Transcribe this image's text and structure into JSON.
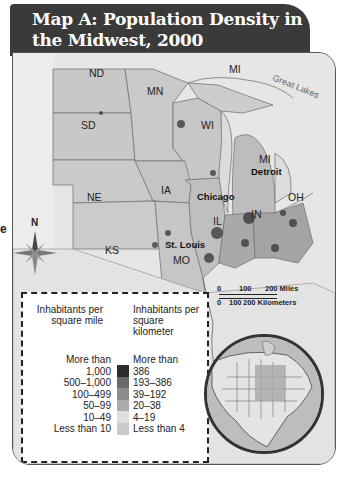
{
  "title": {
    "line1": "Map A: Population Density in",
    "line2": "the Midwest, 2000"
  },
  "map": {
    "water_label": "Great Lakes",
    "states": [
      {
        "abbr": "ND",
        "x": 76,
        "y": 70
      },
      {
        "abbr": "SD",
        "x": 68,
        "y": 120
      },
      {
        "abbr": "NE",
        "x": 74,
        "y": 190
      },
      {
        "abbr": "KS",
        "x": 92,
        "y": 243
      },
      {
        "abbr": "MN",
        "x": 136,
        "y": 88
      },
      {
        "abbr": "WI",
        "x": 190,
        "y": 120
      },
      {
        "abbr": "MI",
        "x": 216,
        "y": 64
      },
      {
        "abbr": "MI",
        "x": 246,
        "y": 153
      },
      {
        "abbr": "IA",
        "x": 150,
        "y": 183
      },
      {
        "abbr": "IL",
        "x": 200,
        "y": 214
      },
      {
        "abbr": "IN",
        "x": 240,
        "y": 209
      },
      {
        "abbr": "OH",
        "x": 277,
        "y": 190
      },
      {
        "abbr": "MO",
        "x": 160,
        "y": 253
      }
    ],
    "cities": [
      {
        "name": "Detroit",
        "x": 238,
        "y": 166
      },
      {
        "name": "Chicago",
        "x": 184,
        "y": 190
      },
      {
        "name": "St. Louis",
        "x": 152,
        "y": 238
      }
    ],
    "compass_label": "N",
    "scale": {
      "miles_ticks": [
        "0",
        "100",
        "200 Miles"
      ],
      "km_ticks": [
        "0",
        "100",
        "200 Kilometers"
      ]
    }
  },
  "legend": {
    "heading_mile": "Inhabitants per square mile",
    "heading_km": "Inhabitants per square kilometer",
    "rows": [
      {
        "mile": "More than 1,000",
        "km": "More than 386",
        "color": "#2e2e2e"
      },
      {
        "mile": "500–1,000",
        "km": "193–386",
        "color": "#6a6a6a"
      },
      {
        "mile": "100–499",
        "km": "39–192",
        "color": "#8d8d8d"
      },
      {
        "mile": "50–99",
        "km": "20–38",
        "color": "#ababab"
      },
      {
        "mile": "10–49",
        "km": "4–19",
        "color": "#cfcfcf"
      },
      {
        "mile": "Less than 10",
        "km": "Less than 4",
        "color": "#c4c4c4"
      }
    ]
  },
  "edge_fragment": "e"
}
